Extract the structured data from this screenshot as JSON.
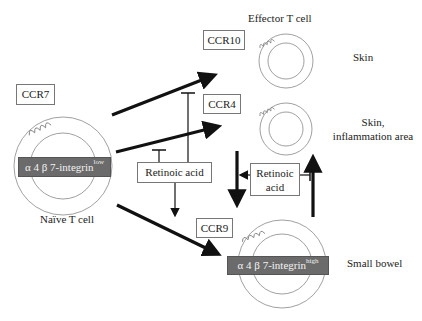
{
  "title": "Effector T cell",
  "naive_cell": {
    "label": "Naïve T cell",
    "receptor": "CCR7",
    "integrin": {
      "base": "α 4 β 7-integrin",
      "level": "low"
    }
  },
  "effector_cells": [
    {
      "receptor": "CCR10",
      "target": "Skin"
    },
    {
      "receptor": "CCR4",
      "target": "Skin,\ninflammation area",
      "target_line1": "Skin,",
      "target_line2": "inflammation area"
    },
    {
      "receptor": "CCR9",
      "target": "Small bowel",
      "integrin": {
        "base": "α 4 β 7-integrin",
        "level": "high"
      }
    }
  ],
  "regulators": [
    {
      "id": "ra_left",
      "label": "Retinoic acid",
      "effects": [
        "inhibits CCR10 path",
        "inhibits CCR4 path",
        "promotes CCR9 path"
      ]
    },
    {
      "id": "ra_right",
      "label_line1": "Retinoic",
      "label_line2": "acid",
      "effects": [
        "promotes CCR4→CCR9 switch",
        "inhibits CCR9→CCR4 switch"
      ]
    }
  ],
  "colors": {
    "arrow": "#111111",
    "cell_outline": "#888888",
    "integrin_bar": "#6b6b6b",
    "box_border": "#777777"
  }
}
